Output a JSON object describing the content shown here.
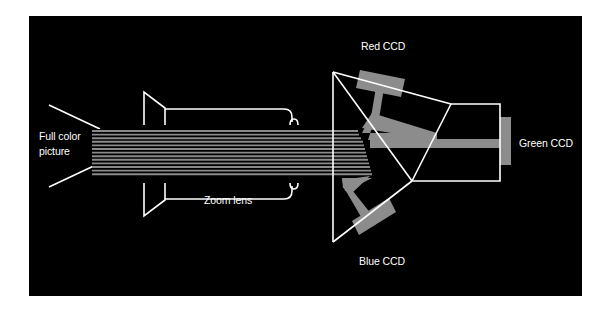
{
  "diagram": {
    "labels": {
      "source": [
        "Full color",
        "picture"
      ],
      "lens": "Zoom lens",
      "red": "Red CCD",
      "green": "Green CCD",
      "blue": "Blue CCD"
    },
    "colors": {
      "background": "#000000",
      "outline": "#ffffff",
      "beam": "#8c8c8c",
      "ccd": "#8c8c8c",
      "page": "#ffffff"
    },
    "components": [
      {
        "id": "input-picture",
        "label": "Full color picture"
      },
      {
        "id": "zoom-lens",
        "label": "Zoom lens"
      },
      {
        "id": "prism-block",
        "label": "Dichroic prism"
      },
      {
        "id": "red-ccd",
        "label": "Red CCD"
      },
      {
        "id": "green-ccd",
        "label": "Green CCD"
      },
      {
        "id": "blue-ccd",
        "label": "Blue CCD"
      }
    ],
    "edges": [
      {
        "from": "input-picture",
        "to": "zoom-lens"
      },
      {
        "from": "zoom-lens",
        "to": "prism-block"
      },
      {
        "from": "prism-block",
        "to": "red-ccd"
      },
      {
        "from": "prism-block",
        "to": "green-ccd"
      },
      {
        "from": "prism-block",
        "to": "blue-ccd"
      }
    ]
  }
}
